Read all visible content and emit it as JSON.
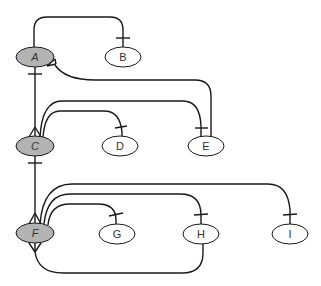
{
  "diagram": {
    "type": "entity-relationship (crow's foot notation)",
    "colors": {
      "entity_fill": "#b3b3b3",
      "attribute_fill": "#ffffff",
      "stroke": "#1a1a1a"
    },
    "nodes": [
      {
        "id": "A",
        "label": "A",
        "shaded": true,
        "italic": true
      },
      {
        "id": "B",
        "label": "B",
        "shaded": false
      },
      {
        "id": "C",
        "label": "C",
        "shaded": true,
        "italic": true
      },
      {
        "id": "D",
        "label": "D",
        "shaded": false
      },
      {
        "id": "E",
        "label": "E",
        "shaded": false
      },
      {
        "id": "F",
        "label": "F",
        "shaded": true,
        "italic": true
      },
      {
        "id": "G",
        "label": "G",
        "shaded": false
      },
      {
        "id": "H",
        "label": "H",
        "shaded": false
      },
      {
        "id": "I",
        "label": "I",
        "shaded": false
      }
    ],
    "edges": [
      {
        "from": "A",
        "to": "B",
        "from_end": "none",
        "to_end": "one"
      },
      {
        "from": "A",
        "to": "C",
        "from_end": "one",
        "to_end": "many"
      },
      {
        "from": "A",
        "to": "E",
        "from_end": "many",
        "to_end": "none"
      },
      {
        "from": "C",
        "to": "D",
        "from_end": "many",
        "to_end": "one"
      },
      {
        "from": "C",
        "to": "E",
        "from_end": "many",
        "to_end": "one"
      },
      {
        "from": "C",
        "to": "F",
        "from_end": "one",
        "to_end": "many"
      },
      {
        "from": "F",
        "to": "G",
        "from_end": "many",
        "to_end": "one"
      },
      {
        "from": "F",
        "to": "H",
        "from_end": "many",
        "to_end": "one"
      },
      {
        "from": "F",
        "to": "I",
        "from_end": "many",
        "to_end": "one"
      },
      {
        "from": "F",
        "to": "H",
        "from_end": "many",
        "to_end": "none",
        "route": "below"
      }
    ]
  }
}
